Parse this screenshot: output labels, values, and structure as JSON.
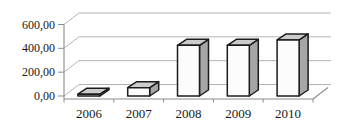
{
  "chart_data": {
    "type": "bar",
    "variant": "3d-column",
    "title": "",
    "xlabel": "",
    "ylabel": "",
    "categories": [
      "2006",
      "2007",
      "2008",
      "2009",
      "2010"
    ],
    "values": [
      15,
      70,
      425,
      425,
      470
    ],
    "ylim": [
      0,
      600
    ],
    "y_ticks": [
      0,
      200,
      400,
      600
    ],
    "y_tick_labels": [
      "0,00",
      "200,00",
      "400,00",
      "600,00"
    ],
    "number_format": "decimal-comma",
    "grid": true,
    "legend": false,
    "colors": {
      "background": "#ffffff",
      "bar_front": "#fcfcfc",
      "bar_side": "#a6a6a6",
      "bar_top": "#cccccc",
      "bar_outline": "#1c1c1c",
      "gridline": "#ababab",
      "axis": "#8c8c8c",
      "label_text": "#1a1a1a"
    }
  }
}
